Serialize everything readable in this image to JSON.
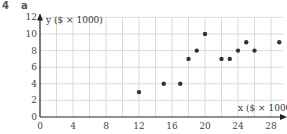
{
  "question": {
    "number": "4",
    "part": "a"
  },
  "chart_data": {
    "type": "scatter",
    "title": "",
    "xlabel": "x ($ × 1000)",
    "ylabel": "y ($ × 1000)",
    "xlim": [
      0,
      29.5
    ],
    "ylim": [
      0,
      12
    ],
    "x_ticks": [
      0,
      4,
      8,
      12,
      16,
      20,
      24,
      28
    ],
    "y_ticks": [
      0,
      2,
      4,
      6,
      8,
      10,
      12
    ],
    "grid": true,
    "grid_step": 2,
    "legend": null,
    "points": [
      {
        "x": 12,
        "y": 3
      },
      {
        "x": 15,
        "y": 4
      },
      {
        "x": 17,
        "y": 4
      },
      {
        "x": 18,
        "y": 7
      },
      {
        "x": 19,
        "y": 8
      },
      {
        "x": 20,
        "y": 10
      },
      {
        "x": 22,
        "y": 7
      },
      {
        "x": 23,
        "y": 7
      },
      {
        "x": 24,
        "y": 8
      },
      {
        "x": 25,
        "y": 9
      },
      {
        "x": 26,
        "y": 8
      },
      {
        "x": 29,
        "y": 9
      }
    ],
    "colors": {
      "points": "#333333",
      "grid": "#d0d0d0",
      "axis": "#222222"
    }
  }
}
